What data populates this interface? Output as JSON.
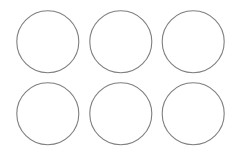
{
  "figure": {
    "background_color": "#ffffff",
    "stroke_color": "#7f7f7f",
    "rows": 2,
    "columns": 3,
    "shapes": [
      {
        "type": "circle",
        "row": 1,
        "column": 1,
        "filled": false
      },
      {
        "type": "circle",
        "row": 1,
        "column": 2,
        "filled": false
      },
      {
        "type": "circle",
        "row": 1,
        "column": 3,
        "filled": false
      },
      {
        "type": "circle",
        "row": 2,
        "column": 1,
        "filled": false
      },
      {
        "type": "circle",
        "row": 2,
        "column": 2,
        "filled": false
      },
      {
        "type": "circle",
        "row": 2,
        "column": 3,
        "filled": false
      }
    ]
  }
}
